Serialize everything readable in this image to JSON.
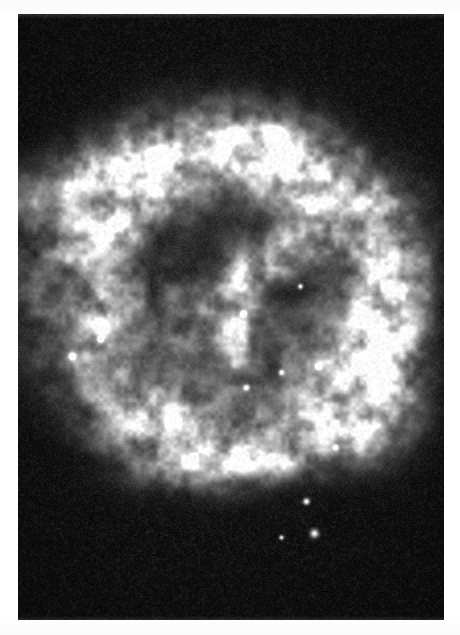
{
  "document": {
    "kind": "astronomical-photographic-plate",
    "page_background": "#ffffff",
    "caption": ""
  },
  "plate": {
    "name": "supernova-remnant-plate",
    "frame": {
      "x": 18,
      "y": 14,
      "width": 426,
      "height": 606
    },
    "background_color": "#0b0b0b",
    "highlight_color": "#ffffff",
    "midtone_color": "#8a8a8a",
    "grain_opacity": 0.5,
    "palette": {
      "sky": "#0c0c0c",
      "faint_nebulosity": "#2a2a2a",
      "mid_filament": "#7d7d7d",
      "bright_filament": "#cfcfcf",
      "peak_knot": "#ffffff"
    }
  },
  "chart_data": {
    "type": "heatmap",
    "title": "",
    "xlabel": "",
    "ylabel": "",
    "grid": false,
    "legend": "none",
    "xlim": [
      0,
      426
    ],
    "ylim": [
      0,
      606
    ],
    "colormap": "grayscale",
    "vmin": 0,
    "vmax": 255,
    "background_level": 14,
    "noise_sigma": 9,
    "shell": {
      "center_x": 218,
      "center_y": 290,
      "radius_x": 175,
      "radius_y": 165,
      "thickness": 62,
      "mean_level": 95
    },
    "filaments": [
      {
        "name": "north-rim-bright-arc",
        "x": 120,
        "y": 170,
        "rx": 130,
        "ry": 34,
        "rot": -16,
        "peak": 235
      },
      {
        "name": "north-east-rim",
        "x": 300,
        "y": 175,
        "rx": 96,
        "ry": 40,
        "rot": 22,
        "peak": 230
      },
      {
        "name": "north-west-rim",
        "x": 128,
        "y": 215,
        "rx": 74,
        "ry": 26,
        "rot": -26,
        "peak": 215
      },
      {
        "name": "east-limb-bright",
        "x": 385,
        "y": 300,
        "rx": 46,
        "ry": 96,
        "rot": 6,
        "peak": 250
      },
      {
        "name": "east-limb-lower",
        "x": 372,
        "y": 385,
        "rx": 54,
        "ry": 62,
        "rot": -14,
        "peak": 235
      },
      {
        "name": "west-limb",
        "x": 106,
        "y": 300,
        "rx": 34,
        "ry": 86,
        "rot": 4,
        "peak": 180
      },
      {
        "name": "south-west-arc",
        "x": 160,
        "y": 430,
        "rx": 62,
        "ry": 36,
        "rot": 24,
        "peak": 215
      },
      {
        "name": "south-rim-arc",
        "x": 248,
        "y": 460,
        "rx": 96,
        "ry": 26,
        "rot": -6,
        "peak": 225
      },
      {
        "name": "interior-vertical-filament",
        "x": 238,
        "y": 305,
        "rx": 18,
        "ry": 70,
        "rot": 2,
        "peak": 200
      },
      {
        "name": "interior-diagonal-wisp",
        "x": 280,
        "y": 250,
        "rx": 70,
        "ry": 28,
        "rot": -34,
        "peak": 190
      },
      {
        "name": "interior-central-haze",
        "x": 210,
        "y": 330,
        "rx": 80,
        "ry": 60,
        "rot": 10,
        "peak": 120
      },
      {
        "name": "south-east-wisp",
        "x": 330,
        "y": 430,
        "rx": 56,
        "ry": 34,
        "rot": 18,
        "peak": 185
      }
    ],
    "detached_knots": [
      {
        "name": "north-detached-knot-chain-a",
        "x": 232,
        "y": 135,
        "r": 9,
        "peak": 235
      },
      {
        "name": "north-detached-knot-chain-b",
        "x": 252,
        "y": 128,
        "r": 7,
        "peak": 225
      },
      {
        "name": "north-detached-knot-chain-c",
        "x": 272,
        "y": 133,
        "r": 8,
        "peak": 230
      },
      {
        "name": "north-detached-knot-chain-d",
        "x": 292,
        "y": 150,
        "r": 6,
        "peak": 205
      }
    ],
    "point_sources": [
      {
        "name": "star-west-double",
        "x": 72,
        "y": 356,
        "r": 3.4,
        "peak": 255
      },
      {
        "name": "star-west-inner",
        "x": 100,
        "y": 339,
        "r": 2.6,
        "peak": 240
      },
      {
        "name": "star-center",
        "x": 243,
        "y": 313,
        "r": 2.4,
        "peak": 250
      },
      {
        "name": "star-interior-a",
        "x": 281,
        "y": 372,
        "r": 2.4,
        "peak": 240
      },
      {
        "name": "star-interior-b",
        "x": 246,
        "y": 387,
        "r": 2.6,
        "peak": 245
      },
      {
        "name": "star-interior-c",
        "x": 300,
        "y": 286,
        "r": 2.2,
        "peak": 235
      },
      {
        "name": "star-east-knot",
        "x": 318,
        "y": 366,
        "r": 2.6,
        "peak": 250
      },
      {
        "name": "star-south-a",
        "x": 306,
        "y": 501,
        "r": 2.8,
        "peak": 255
      },
      {
        "name": "star-south-b",
        "x": 314,
        "y": 533,
        "r": 3.6,
        "peak": 250
      },
      {
        "name": "star-south-c",
        "x": 281,
        "y": 537,
        "r": 2.0,
        "peak": 235
      },
      {
        "name": "star-south-east",
        "x": 335,
        "y": 447,
        "r": 2.2,
        "peak": 235
      }
    ]
  }
}
